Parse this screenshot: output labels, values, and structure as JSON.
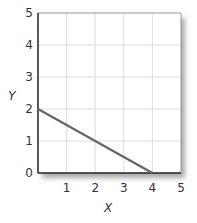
{
  "chart_data": {
    "type": "line",
    "title": "",
    "xlabel": "X",
    "ylabel": "Y",
    "xlim": [
      0,
      5
    ],
    "ylim": [
      0,
      5
    ],
    "x_ticks": [
      "1",
      "2",
      "3",
      "4",
      "5"
    ],
    "y_ticks": [
      "0",
      "1",
      "2",
      "3",
      "4",
      "5"
    ],
    "grid": true,
    "legend": null,
    "series": [
      {
        "name": "line",
        "x": [
          0,
          4
        ],
        "y": [
          2,
          0
        ],
        "color": "#666666"
      }
    ]
  },
  "colors": {
    "line": "#666666",
    "grid": "#dddddd",
    "axis": "#222222",
    "shadow": "#bbbbbb"
  }
}
